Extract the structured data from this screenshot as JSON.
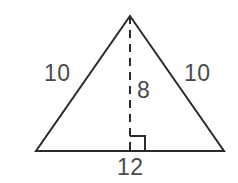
{
  "figure": {
    "kind": "isosceles-triangle-with-altitude",
    "background_color": "#ffffff",
    "stroke_color": "#2b2b2b",
    "label_color": "#4a4a4a",
    "stroke_width": 2,
    "vertices": {
      "apex": {
        "x": 130,
        "y": 16
      },
      "bottom_left": {
        "x": 36,
        "y": 151
      },
      "bottom_right": {
        "x": 224,
        "y": 151
      }
    },
    "altitude": {
      "from": {
        "x": 130,
        "y": 16
      },
      "to": {
        "x": 130,
        "y": 151
      },
      "style": "dashed",
      "dash_pattern": "8 6"
    },
    "right_angle_marker": {
      "size": 15,
      "corner": {
        "x": 130,
        "y": 151
      },
      "opens": "right-and-up"
    },
    "labels": {
      "left_leg": "10",
      "right_leg": "10",
      "altitude": "8",
      "base": "12"
    }
  }
}
